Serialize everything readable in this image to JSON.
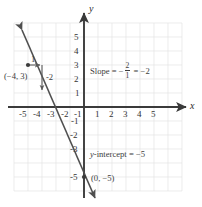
{
  "figure": {
    "type": "coordinate-graph",
    "axes": {
      "x_label": "x",
      "y_label": "y",
      "x_ticks_negative": [
        "-5",
        "-4",
        "-3",
        "-2",
        "-1"
      ],
      "x_ticks_positive": [
        "1",
        "2",
        "3",
        "4",
        "5"
      ],
      "y_ticks_positive": [
        "5",
        "4",
        "3",
        "2",
        "1"
      ],
      "y_ticks_negative": [
        "-1",
        "-2",
        "-3",
        "-5"
      ],
      "x_range": [
        -6,
        6
      ],
      "y_range": [
        -6,
        6
      ],
      "grid": true
    },
    "line": {
      "equation_slope": -2,
      "equation_intercept": -5,
      "color": "#4a4a4a",
      "arrows_both_ends": true
    },
    "slope_triangle": {
      "run_label": "1",
      "rise_label": "-2",
      "from_point": [
        -4,
        3
      ]
    },
    "annotations": {
      "slope_prefix": "Slope",
      "equals": "=",
      "slope_sign": "−",
      "slope_numerator": "2",
      "slope_denominator": "1",
      "slope_value": "−2",
      "intercept_text_prefix": "y",
      "intercept_text_rest": "-intercept",
      "intercept_value": "−5",
      "point_label_upper": "(−4, 3)",
      "point_label_lower": "(0, −5)"
    },
    "colors": {
      "grid": "#e2e2e2",
      "axis": "#3a3a3a",
      "line": "#4f4f4f",
      "text": "#3a3a3a",
      "background": "#ffffff"
    }
  }
}
